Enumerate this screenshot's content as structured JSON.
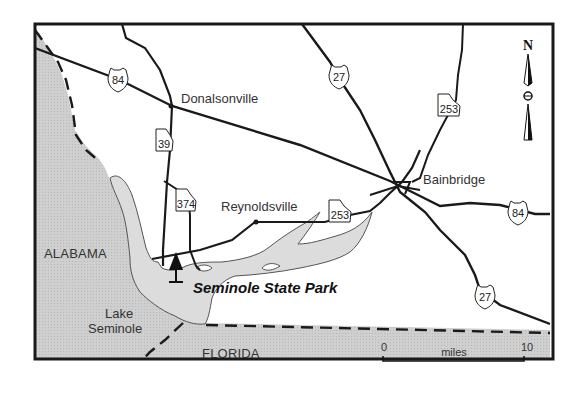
{
  "map": {
    "title": "Seminole State Park",
    "places": {
      "donalsonville": "Donalsonville",
      "bainbridge": "Bainbridge",
      "reynoldsville": "Reynoldsville",
      "lake_line1": "Lake",
      "lake_line2": "Seminole"
    },
    "states": {
      "alabama": "ALABAMA",
      "florida": "FLORIDA"
    },
    "park_label": "Seminole State Park",
    "highways": {
      "us84_west": "84",
      "us84_east": "84",
      "us27_north": "27",
      "us27_south": "27",
      "ga39": "39",
      "ga374": "374",
      "ga253_north": "253",
      "ga253_south": "253"
    },
    "north_arrow": "N",
    "scale": {
      "start": "0",
      "unit": "miles",
      "end": "10"
    },
    "colors": {
      "land_shade": "#c8c8c8",
      "water": "#dcdcdc",
      "roads": "#1a1a1a",
      "background": "#ffffff"
    }
  }
}
